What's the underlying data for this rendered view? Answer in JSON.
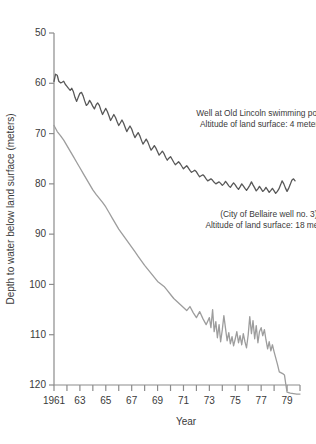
{
  "chart_data": {
    "type": "line",
    "title": "",
    "xlabel": "Year",
    "ylabel": "Depth to water below land surface (meters)",
    "xlim": [
      1961,
      1980
    ],
    "ylim": [
      120,
      50
    ],
    "y_inverted": true,
    "grid": false,
    "legend": "none",
    "y_ticks": [
      50,
      60,
      70,
      80,
      90,
      100,
      110,
      120
    ],
    "y_tick_labels": [
      "50",
      "60",
      "70",
      "80",
      "90",
      "100",
      "110",
      "120"
    ],
    "x_ticks": [
      1961,
      1962,
      1963,
      1964,
      1965,
      1966,
      1967,
      1968,
      1969,
      1970,
      1971,
      1972,
      1973,
      1974,
      1975,
      1976,
      1977,
      1978,
      1979,
      1980
    ],
    "x_tick_labels": [
      "1961",
      "",
      "63",
      "",
      "65",
      "",
      "67",
      "",
      "69",
      "",
      "71",
      "",
      "73",
      "",
      "75",
      "",
      "77",
      "",
      "79",
      ""
    ],
    "annotations": [
      {
        "name": "old-lincoln-label",
        "lines": [
          "Well at Old Lincoln swimming pool.",
          "Altitude of land surface: 4 meters"
        ],
        "x": 1977.0,
        "y": 66.5
      },
      {
        "name": "bellaire-label",
        "lines": [
          "(City of Bellaire well no. 3)",
          "Altitude of land surface: 18 meters"
        ],
        "x": 1977.6,
        "y": 86.5
      }
    ],
    "series": [
      {
        "name": "Well at Old Lincoln swimming pool",
        "color": "#585858",
        "width": 1.3,
        "x": [
          1961.0,
          1961.12,
          1961.25,
          1961.37,
          1961.5,
          1961.62,
          1961.75,
          1961.87,
          1962.0,
          1962.12,
          1962.25,
          1962.37,
          1962.5,
          1962.62,
          1962.75,
          1962.87,
          1963.0,
          1963.12,
          1963.25,
          1963.37,
          1963.5,
          1963.62,
          1963.75,
          1963.87,
          1964.0,
          1964.12,
          1964.25,
          1964.37,
          1964.5,
          1964.62,
          1964.75,
          1964.87,
          1965.0,
          1965.12,
          1965.25,
          1965.37,
          1965.5,
          1965.62,
          1965.75,
          1965.87,
          1966.0,
          1966.12,
          1966.25,
          1966.37,
          1966.5,
          1966.62,
          1966.75,
          1966.87,
          1967.0,
          1967.12,
          1967.25,
          1967.37,
          1967.5,
          1967.62,
          1967.75,
          1967.87,
          1968.0,
          1968.12,
          1968.25,
          1968.37,
          1968.5,
          1968.62,
          1968.75,
          1968.87,
          1969.0,
          1969.12,
          1969.25,
          1969.37,
          1969.5,
          1969.62,
          1969.75,
          1969.87,
          1970.0,
          1970.12,
          1970.25,
          1970.37,
          1970.5,
          1970.62,
          1970.75,
          1970.87,
          1971.0,
          1971.12,
          1971.25,
          1971.37,
          1971.5,
          1971.62,
          1971.75,
          1971.87,
          1972.0,
          1972.12,
          1972.25,
          1972.37,
          1972.5,
          1972.62,
          1972.75,
          1972.87,
          1973.0,
          1973.12,
          1973.25,
          1973.37,
          1973.5,
          1973.62,
          1973.75,
          1973.87,
          1974.0,
          1974.12,
          1974.25,
          1974.37,
          1974.5,
          1974.62,
          1974.75,
          1974.87,
          1975.0,
          1975.12,
          1975.25,
          1975.37,
          1975.5,
          1975.62,
          1975.75,
          1975.87,
          1976.0,
          1976.12,
          1976.25,
          1976.37,
          1976.5,
          1976.62,
          1976.75,
          1976.87,
          1977.0,
          1977.12,
          1977.25,
          1977.37,
          1977.5,
          1977.62,
          1977.75,
          1977.87,
          1978.0,
          1978.12,
          1978.25,
          1978.37,
          1978.5,
          1978.62,
          1978.75,
          1978.87,
          1979.0,
          1979.12,
          1979.25,
          1979.37,
          1979.5,
          1979.62
        ],
        "y": [
          59.6,
          58.2,
          58.4,
          59.6,
          59.9,
          59.8,
          59.6,
          60.2,
          60.6,
          61.0,
          61.4,
          61.0,
          61.7,
          62.8,
          63.6,
          62.8,
          62.0,
          61.8,
          62.5,
          63.5,
          64.4,
          64.1,
          63.4,
          63.9,
          64.6,
          65.1,
          64.3,
          63.9,
          64.4,
          65.3,
          66.2,
          65.6,
          65.0,
          65.6,
          66.5,
          67.4,
          66.8,
          66.2,
          66.8,
          67.6,
          68.4,
          67.9,
          67.3,
          67.9,
          68.8,
          69.6,
          69.0,
          68.5,
          69.1,
          70.0,
          70.8,
          70.3,
          69.8,
          70.4,
          71.3,
          72.1,
          71.6,
          71.1,
          71.7,
          72.5,
          73.3,
          72.9,
          72.4,
          72.9,
          73.6,
          74.3,
          73.9,
          73.5,
          74.0,
          74.7,
          75.3,
          74.9,
          74.6,
          75.1,
          75.7,
          76.2,
          75.9,
          75.6,
          76.0,
          76.5,
          77.0,
          76.7,
          76.4,
          76.8,
          77.3,
          77.7,
          77.5,
          77.3,
          77.6,
          78.1,
          78.6,
          78.4,
          78.2,
          78.5,
          79.0,
          79.4,
          79.2,
          79.0,
          79.3,
          79.7,
          80.0,
          79.8,
          79.6,
          79.9,
          80.3,
          80.0,
          79.5,
          79.9,
          80.4,
          80.7,
          80.2,
          79.8,
          80.2,
          80.7,
          81.1,
          80.6,
          80.0,
          80.4,
          80.9,
          81.3,
          80.8,
          80.3,
          79.6,
          80.2,
          80.8,
          81.4,
          81.0,
          80.5,
          81.0,
          81.5,
          81.2,
          80.7,
          81.2,
          81.7,
          81.3,
          80.9,
          81.4,
          81.9,
          81.5,
          81.0,
          80.2,
          79.4,
          80.0,
          80.8,
          81.5,
          80.9,
          80.1,
          79.3,
          79.0,
          79.4
        ]
      },
      {
        "name": "City of Bellaire well no. 3",
        "color": "#9d9d9d",
        "width": 1.3,
        "x": [
          1961.0,
          1961.25,
          1961.5,
          1961.75,
          1962.0,
          1962.25,
          1962.5,
          1962.75,
          1963.0,
          1963.25,
          1963.5,
          1963.75,
          1964.0,
          1964.25,
          1964.5,
          1964.75,
          1965.0,
          1965.25,
          1965.5,
          1965.75,
          1966.0,
          1966.25,
          1966.5,
          1966.75,
          1967.0,
          1967.25,
          1967.5,
          1967.75,
          1968.0,
          1968.25,
          1968.5,
          1968.75,
          1969.0,
          1969.25,
          1969.5,
          1969.75,
          1970.0,
          1970.25,
          1970.5,
          1970.75,
          1971.0,
          1971.25,
          1971.5,
          1971.75,
          1972.0,
          1972.25,
          1972.5,
          1972.75,
          1973.0,
          1973.12,
          1973.25,
          1973.37,
          1973.5,
          1973.62,
          1973.75,
          1973.87,
          1974.0,
          1974.12,
          1974.25,
          1974.37,
          1974.5,
          1974.62,
          1974.75,
          1974.87,
          1975.0,
          1975.12,
          1975.25,
          1975.37,
          1975.5,
          1975.62,
          1975.75,
          1975.87,
          1976.0,
          1976.12,
          1976.25,
          1976.37,
          1976.5,
          1976.62,
          1976.75,
          1976.87,
          1977.0,
          1977.12,
          1977.25,
          1977.37,
          1977.5,
          1977.62,
          1977.75,
          1977.87,
          1978.0,
          1978.25,
          1978.4,
          1978.55,
          1978.7,
          1978.8,
          1978.9,
          1979.0,
          1979.25,
          1979.5,
          1979.75,
          1980.0
        ],
        "y": [
          68.4,
          69.6,
          70.4,
          71.3,
          72.4,
          73.5,
          74.6,
          75.7,
          76.8,
          77.9,
          79.0,
          80.1,
          81.2,
          82.1,
          82.9,
          83.7,
          84.6,
          85.7,
          86.8,
          87.9,
          89.0,
          89.9,
          90.8,
          91.7,
          92.6,
          93.5,
          94.4,
          95.3,
          96.2,
          97.0,
          97.8,
          98.6,
          99.4,
          99.9,
          100.4,
          101.2,
          102.0,
          102.8,
          103.4,
          104.0,
          104.6,
          105.2,
          104.4,
          105.6,
          106.6,
          105.4,
          106.8,
          108.0,
          106.6,
          108.6,
          105.0,
          109.4,
          107.4,
          110.6,
          108.0,
          111.4,
          109.0,
          106.2,
          108.8,
          111.2,
          109.6,
          111.8,
          110.4,
          112.2,
          110.8,
          109.4,
          111.6,
          110.2,
          112.0,
          109.8,
          111.4,
          112.6,
          110.0,
          106.4,
          109.8,
          107.2,
          110.8,
          108.2,
          111.6,
          109.4,
          108.6,
          110.2,
          109.0,
          111.0,
          112.8,
          111.4,
          113.2,
          112.0,
          113.4,
          115.8,
          117.4,
          117.6,
          117.8,
          118.0,
          119.8,
          121.4,
          121.6,
          121.7,
          121.8,
          121.8
        ]
      }
    ]
  },
  "plot": {
    "left": 54,
    "top": 33,
    "right": 300,
    "bottom": 385
  }
}
